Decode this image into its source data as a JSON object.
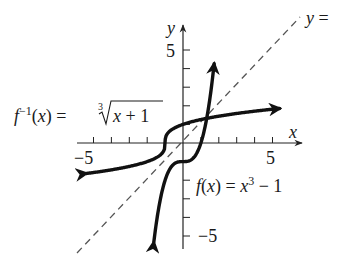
{
  "figure": {
    "title": "",
    "axes": {
      "x_label": "x",
      "y_label": "y",
      "x_tick_labels": {
        "neg": "−5",
        "pos": "5"
      },
      "y_tick_labels": {
        "pos": "5",
        "neg": "−5"
      },
      "x_range": [
        -6,
        6.5
      ],
      "y_range": [
        -6,
        6.3
      ],
      "tick_step": 1
    },
    "curves": [
      {
        "name": "f",
        "label_lhs": "f(x) = x",
        "label_exp": "3",
        "label_rhs": " − 1",
        "equation": "f(x) = x^3 − 1",
        "style": "solid-thick",
        "color": "#111111"
      },
      {
        "name": "f_inverse",
        "label_f": "f",
        "label_sup": "−1",
        "label_mid": "(x) = ",
        "label_index": "3",
        "label_radicand": "x + 1",
        "equation": "f^{-1}(x) = ∛(x + 1)",
        "style": "solid-thick",
        "color": "#111111"
      },
      {
        "name": "identity",
        "label": "y = x",
        "label_visible": "y = ",
        "equation": "y = x",
        "style": "dashed",
        "color": "#555555"
      }
    ]
  },
  "chart_data": {
    "type": "line",
    "title": "",
    "xlabel": "x",
    "ylabel": "y",
    "xlim": [
      -6,
      6.5
    ],
    "ylim": [
      -6,
      6.3
    ],
    "x_ticks": [
      -5,
      -4,
      -3,
      -2,
      -1,
      1,
      2,
      3,
      4,
      5
    ],
    "y_ticks": [
      -5,
      -4,
      -3,
      -2,
      -1,
      1,
      2,
      3,
      4,
      5
    ],
    "labeled_ticks": {
      "x": [
        -5,
        5
      ],
      "y": [
        5,
        -5
      ]
    },
    "grid": false,
    "series": [
      {
        "name": "f(x) = x^3 − 1",
        "x": [
          -1.6,
          -1.2,
          -1,
          -0.5,
          0,
          0.5,
          1,
          1.2,
          1.6,
          1.75
        ],
        "y": [
          -5.1,
          -2.73,
          -2,
          -1.13,
          -1,
          -0.88,
          0,
          0.73,
          3.1,
          4.36
        ]
      },
      {
        "name": "f^{-1}(x) = ∛(x + 1)",
        "x": [
          -5.5,
          -4,
          -2,
          -1.13,
          -1,
          -0.88,
          0,
          2,
          4,
          5.4
        ],
        "y": [
          -1.65,
          -1.44,
          -1,
          -0.5,
          0,
          0.5,
          1,
          1.44,
          1.71,
          1.85
        ]
      },
      {
        "name": "y = x",
        "x": [
          -5.9,
          6.5
        ],
        "y": [
          -5.9,
          6.5
        ],
        "style": "dashed"
      }
    ]
  }
}
